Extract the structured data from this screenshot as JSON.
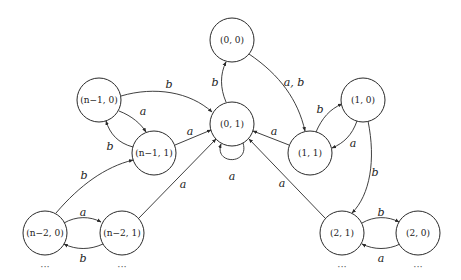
{
  "diagram": {
    "type": "state-transition-graph",
    "nodes": [
      {
        "id": "n00",
        "label": "(0, 0)",
        "x": 232,
        "y": 40
      },
      {
        "id": "n01",
        "label": "(0, 1)",
        "x": 232,
        "y": 124
      },
      {
        "id": "nm10",
        "label": "(n−1, 0)",
        "x": 99,
        "y": 100
      },
      {
        "id": "nm11",
        "label": "(n−1, 1)",
        "x": 154,
        "y": 153
      },
      {
        "id": "n10",
        "label": "(1, 0)",
        "x": 363,
        "y": 100
      },
      {
        "id": "n11",
        "label": "(1, 1)",
        "x": 310,
        "y": 153
      },
      {
        "id": "nm20",
        "label": "(n−2, 0)",
        "x": 45,
        "y": 233
      },
      {
        "id": "nm21",
        "label": "(n−2, 1)",
        "x": 122,
        "y": 233
      },
      {
        "id": "n21",
        "label": "(2, 1)",
        "x": 342,
        "y": 233
      },
      {
        "id": "n20",
        "label": "(2, 0)",
        "x": 418,
        "y": 233
      }
    ],
    "edges": [
      {
        "from": "n01",
        "to": "n00",
        "label": "b"
      },
      {
        "from": "n00",
        "to": "n11",
        "label": "a, b"
      },
      {
        "from": "n01",
        "to": "n01",
        "label": "a"
      },
      {
        "from": "nm10",
        "to": "n01",
        "label": "b"
      },
      {
        "from": "nm10",
        "to": "nm11",
        "label": "a"
      },
      {
        "from": "nm11",
        "to": "nm10",
        "label": "b"
      },
      {
        "from": "nm11",
        "to": "n01",
        "label": "a"
      },
      {
        "from": "nm20",
        "to": "nm11",
        "label": "b"
      },
      {
        "from": "nm21",
        "to": "n01",
        "label": "a"
      },
      {
        "from": "nm20",
        "to": "nm21",
        "label": "a"
      },
      {
        "from": "nm21",
        "to": "nm20",
        "label": "b"
      },
      {
        "from": "n11",
        "to": "n01",
        "label": "a"
      },
      {
        "from": "n11",
        "to": "n10",
        "label": "b"
      },
      {
        "from": "n10",
        "to": "n11",
        "label": "a"
      },
      {
        "from": "n10",
        "to": "n21",
        "label": "b"
      },
      {
        "from": "n21",
        "to": "n01",
        "label": "a"
      },
      {
        "from": "n21",
        "to": "n20",
        "label": "b"
      },
      {
        "from": "n20",
        "to": "n21",
        "label": "a"
      }
    ],
    "continuation_marks": [
      "···",
      "···",
      "···",
      "···"
    ]
  }
}
